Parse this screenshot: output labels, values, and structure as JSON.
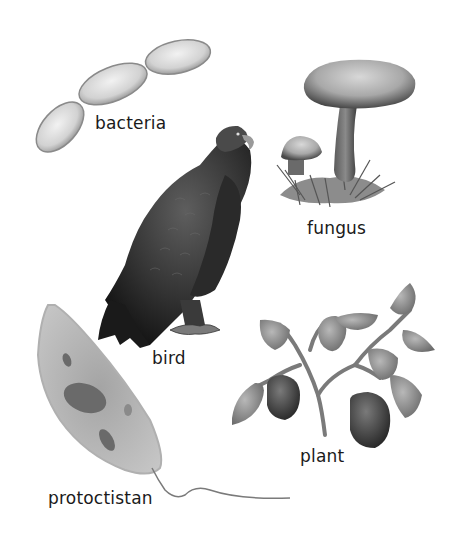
{
  "diagram": {
    "background": "#ffffff",
    "organisms": [
      {
        "id": "bacteria",
        "label": "bacteria"
      },
      {
        "id": "fungus",
        "label": "fungus"
      },
      {
        "id": "bird",
        "label": "bird"
      },
      {
        "id": "plant",
        "label": "plant"
      },
      {
        "id": "protoctistan",
        "label": "protoctistan"
      }
    ]
  }
}
